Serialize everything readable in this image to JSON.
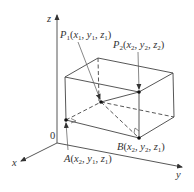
{
  "figure": {
    "axes": {
      "x_label": "x",
      "y_label": "y",
      "z_label": "z",
      "origin_label": "0"
    },
    "points": {
      "P1": {
        "name": "P",
        "sub": "1",
        "coords": [
          "x",
          "1",
          "y",
          "1",
          "z",
          "1"
        ]
      },
      "P2": {
        "name": "P",
        "sub": "2",
        "coords": [
          "x",
          "2",
          "y",
          "2",
          "z",
          "2"
        ]
      },
      "A": {
        "name": "A",
        "coords": [
          "x",
          "2",
          "y",
          "1",
          "z",
          "1"
        ]
      },
      "B": {
        "name": "B",
        "coords": [
          "x",
          "2",
          "y",
          "2",
          "z",
          "1"
        ]
      }
    },
    "colors": {
      "line": "#444444",
      "text": "#333333",
      "background": "#ffffff"
    }
  }
}
